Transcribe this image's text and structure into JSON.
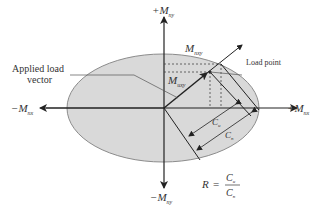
{
  "diagram": {
    "colors": {
      "ellipse_fill": "#d9d9d9",
      "ellipse_stroke": "#8c8c8c",
      "line": "#222222",
      "text": "#333333"
    },
    "axes": {
      "pos_y": {
        "sign": "+",
        "symbol": "M",
        "sub": "ny"
      },
      "neg_y": {
        "sign": "−",
        "symbol": "M",
        "sub": "ny"
      },
      "pos_x": {
        "sign": "+",
        "symbol": "M",
        "sub": "nx"
      },
      "neg_x": {
        "sign": "−",
        "symbol": "M",
        "sub": "nx"
      }
    },
    "labels": {
      "applied_load_line1": "Applied load",
      "applied_load_line2": "vector",
      "load_point": "Load point",
      "capacity_moment": {
        "symbol": "M",
        "sub": "nxy"
      },
      "applied_moment": {
        "symbol": "M",
        "sub": "uxy"
      },
      "cu": {
        "symbol": "C",
        "sub": "u"
      },
      "cn": {
        "symbol": "C",
        "sub": "n"
      }
    },
    "formula": {
      "lhs": "R",
      "equals": "=",
      "numerator": {
        "symbol": "C",
        "sub": "u"
      },
      "denominator": {
        "symbol": "C",
        "sub": "n"
      }
    }
  }
}
